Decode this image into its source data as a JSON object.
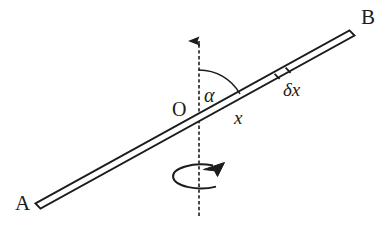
{
  "figure": {
    "background_color": "#ffffff",
    "ink_color": "#1c1c1c",
    "width": 390,
    "height": 232
  },
  "labels": {
    "end_a": "A",
    "end_b": "B",
    "origin": "O",
    "angle": "α",
    "distance": "x",
    "element": "δx"
  },
  "icons": {
    "axis_arrow": "up-arrow-icon",
    "rotation_arrow": "rotation-arrow-icon"
  },
  "geometry": {
    "rod": {
      "a_point": [
        38,
        206
      ],
      "b_point": [
        352,
        33
      ],
      "thickness_px": 6,
      "angle_from_horizontal_deg": 29
    },
    "axis": {
      "x": 199,
      "top_y": 28,
      "bottom_y": 216,
      "style": "dashed-with-arrowhead"
    },
    "origin_point": [
      199,
      117
    ],
    "angle_arc": {
      "center": [
        199,
        117
      ],
      "radius_px": 47,
      "from_deg": 90,
      "to_deg": 29,
      "value_deg": 61
    },
    "mass_element": {
      "center": [
        282,
        72
      ],
      "length_px": 13
    },
    "rotation_ellipse": {
      "center": [
        200,
        176
      ],
      "rx": 28,
      "ry": 12
    }
  }
}
